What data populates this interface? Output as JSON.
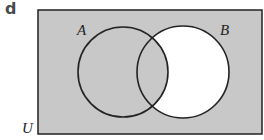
{
  "part_label": "d",
  "diagram": {
    "type": "venn",
    "universe_label": "U",
    "sets": [
      {
        "name": "A",
        "label": "A",
        "cx": 123,
        "cy": 72,
        "r": 45
      },
      {
        "name": "B",
        "label": "B",
        "cx": 183,
        "cy": 72,
        "r": 46
      }
    ],
    "shaded_region": "A ∪ B′ (everything except B only)",
    "colors": {
      "shade": "#c8c8c8",
      "unshaded": "#ffffff",
      "stroke": "#222222"
    }
  }
}
